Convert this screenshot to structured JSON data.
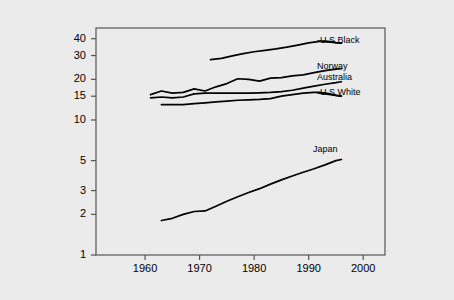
{
  "chart_data": {
    "type": "line",
    "title": "",
    "subtitle": "",
    "xlabel": "",
    "ylabel": "",
    "yscale": "log",
    "xscale": "linear",
    "xlim": [
      1951,
      2004
    ],
    "ylim": [
      1,
      48
    ],
    "grid": false,
    "legend_position": "inline-right-of-line-ends",
    "x_ticks": [
      1960,
      1970,
      1980,
      1990,
      2000
    ],
    "x_tick_labels": [
      "1960",
      "1970",
      "1980",
      "1990",
      "2000"
    ],
    "y_ticks": [
      1,
      2,
      3,
      5,
      10,
      15,
      20,
      30,
      40
    ],
    "y_tick_labels": [
      "1",
      "2",
      "3",
      "5",
      "10",
      "15",
      "20",
      "30",
      "40"
    ],
    "line_color": "#000000",
    "background_color": "#ebebeb",
    "plot_background_color": "#ebebeb",
    "axis_color": "#555555",
    "series": [
      {
        "name": "U.S Black",
        "label": "U.S Black",
        "x": [
          1972,
          1974,
          1976,
          1978,
          1980,
          1982,
          1984,
          1986,
          1988,
          1990,
          1992,
          1993,
          1994,
          1995,
          1996
        ],
        "values": [
          28.0,
          28.6,
          29.8,
          31.0,
          32.0,
          32.8,
          33.6,
          34.6,
          35.8,
          37.2,
          38.2,
          38.4,
          38.0,
          37.4,
          37.0
        ]
      },
      {
        "name": "Norway",
        "label": "Norway",
        "x": [
          1961,
          1963,
          1965,
          1967,
          1969,
          1971,
          1973,
          1975,
          1977,
          1979,
          1981,
          1983,
          1985,
          1987,
          1989,
          1991,
          1993,
          1995,
          1996
        ],
        "values": [
          15.4,
          16.4,
          15.8,
          16.0,
          17.0,
          16.4,
          17.6,
          18.6,
          20.2,
          20.0,
          19.4,
          20.4,
          20.6,
          21.2,
          21.6,
          22.4,
          23.2,
          23.8,
          24.0
        ]
      },
      {
        "name": "Australia",
        "label": "Australia",
        "x": [
          1961,
          1963,
          1965,
          1967,
          1969,
          1971,
          1973,
          1975,
          1977,
          1979,
          1981,
          1983,
          1985,
          1987,
          1989,
          1991,
          1993,
          1995,
          1996
        ],
        "values": [
          14.6,
          14.8,
          14.6,
          14.8,
          15.6,
          15.8,
          15.8,
          15.8,
          15.8,
          15.8,
          15.9,
          16.0,
          16.2,
          16.6,
          17.2,
          17.8,
          18.4,
          18.9,
          19.2
        ]
      },
      {
        "name": "U.S White",
        "label": "U.S White",
        "x": [
          1963,
          1965,
          1967,
          1969,
          1971,
          1973,
          1975,
          1977,
          1979,
          1981,
          1983,
          1985,
          1987,
          1989,
          1991,
          1992,
          1994,
          1995,
          1996
        ],
        "values": [
          13.0,
          13.0,
          13.0,
          13.2,
          13.4,
          13.6,
          13.8,
          14.0,
          14.1,
          14.2,
          14.4,
          15.0,
          15.4,
          15.8,
          16.0,
          16.0,
          15.6,
          15.2,
          15.0
        ]
      },
      {
        "name": "Japan",
        "label": "Japan",
        "x": [
          1963,
          1965,
          1967,
          1969,
          1971,
          1973,
          1975,
          1977,
          1979,
          1981,
          1983,
          1985,
          1987,
          1989,
          1991,
          1993,
          1995,
          1996
        ],
        "values": [
          1.8,
          1.87,
          2.0,
          2.1,
          2.12,
          2.3,
          2.5,
          2.7,
          2.9,
          3.1,
          3.35,
          3.6,
          3.85,
          4.1,
          4.35,
          4.65,
          5.0,
          5.1
        ]
      }
    ]
  },
  "plot_geometry": {
    "frame_left": 96,
    "frame_top": 28,
    "frame_right": 385,
    "frame_bottom": 255
  }
}
